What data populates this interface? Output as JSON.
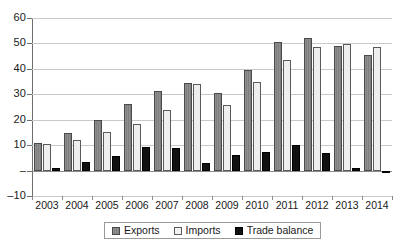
{
  "chart_data": {
    "type": "bar",
    "title": "",
    "subtitle": "",
    "xlabel": "",
    "ylabel": "",
    "categories": [
      "2003",
      "2004",
      "2005",
      "2006",
      "2007",
      "2008",
      "2009",
      "2010",
      "2011",
      "2012",
      "2013",
      "2014"
    ],
    "series": [
      {
        "name": "Exports",
        "color": "#8c8c8c",
        "values": [
          11.0,
          14.8,
          19.7,
          26.2,
          31.2,
          34.4,
          30.5,
          39.4,
          50.6,
          52.2,
          48.8,
          45.3
        ]
      },
      {
        "name": "Imports",
        "color": "#eeeeee",
        "values": [
          10.6,
          12.2,
          15.0,
          18.2,
          24.0,
          34.0,
          25.7,
          34.8,
          43.6,
          48.4,
          49.9,
          48.4
        ]
      },
      {
        "name": "Trade balance",
        "color": "#111111",
        "values": [
          1.0,
          3.2,
          5.6,
          9.3,
          8.9,
          2.9,
          6.1,
          7.2,
          9.9,
          7.0,
          1.2,
          -0.6
        ]
      }
    ],
    "ylim": [
      -10,
      60
    ],
    "ytick_values": [
      60,
      50,
      40,
      30,
      20,
      10,
      0,
      -10
    ],
    "ytick_labels": [
      "60",
      "50",
      "40",
      "30",
      "20",
      "10",
      "–",
      "–10"
    ],
    "grid": true,
    "grid_axis": "y",
    "legend_position": "bottom",
    "legend": [
      "Exports",
      "Imports",
      "Trade balance"
    ]
  }
}
